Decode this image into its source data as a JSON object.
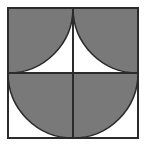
{
  "figure": {
    "kind": "geometry-diagram",
    "title": "",
    "canvas": {
      "width": 147,
      "height": 150,
      "background": "#ffffff"
    },
    "colors": {
      "shaded_fill": "#797979",
      "outline": "#2b2b2b",
      "divider": "#2b2b2b",
      "unshaded_fill": "#ffffff"
    },
    "square": {
      "name": "outer-square",
      "x": 8,
      "y": 8,
      "side": 130,
      "stroke_width": 2,
      "fill": "#ffffff"
    },
    "dividers": [
      {
        "name": "vertical-midline",
        "x1": 73,
        "y1": 8,
        "x2": 73,
        "y2": 138,
        "stroke_width": 2
      },
      {
        "name": "horizontal-midline",
        "x1": 8,
        "y1": 73,
        "x2": 138,
        "y2": 73,
        "stroke_width": 2
      }
    ],
    "shaded_regions": [
      {
        "name": "top-left-quarter-circle",
        "type": "quarter-circle",
        "center": {
          "x": 8,
          "y": 8
        },
        "radius": 65,
        "quadrant": "top-left",
        "shaded": true
      },
      {
        "name": "top-right-quarter-circle",
        "type": "quarter-circle",
        "center": {
          "x": 138,
          "y": 8
        },
        "radius": 65,
        "quadrant": "top-right",
        "shaded": true
      },
      {
        "name": "bottom-semicircle",
        "type": "semicircle",
        "center": {
          "x": 73,
          "y": 73
        },
        "radius": 65,
        "orientation": "flat-side-up",
        "shaded": true
      }
    ],
    "paths": {
      "top_left_quarter": "M 8 8 L 73 8 A 65 65 0 0 1 8 73 Z",
      "top_right_quarter": "M 138 8 L 138 73 A 65 65 0 0 1 73 8 Z",
      "bottom_semicircle": "M 8 73 A 65 65 0 0 0 138 73 Z"
    }
  }
}
